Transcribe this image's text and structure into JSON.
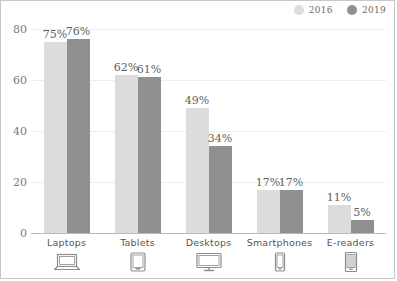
{
  "chart_data": {
    "type": "bar",
    "title": "",
    "subtitle": "",
    "xlabel": "",
    "ylabel": "",
    "ylim": [
      0,
      80
    ],
    "yticks": [
      "0",
      "20",
      "40",
      "60",
      "80"
    ],
    "ytick_values": [
      0,
      20,
      40,
      60,
      80
    ],
    "grid": true,
    "legend_position": "top-right",
    "categories": [
      "Laptops",
      "Tablets",
      "Desktops",
      "Smartphones",
      "E-readers"
    ],
    "category_icons": [
      "laptop-icon",
      "tablet-icon",
      "desktop-monitor-icon",
      "smartphone-icon",
      "e-reader-icon"
    ],
    "series": [
      {
        "name": "2016",
        "color": "#dcdcdc",
        "values": [
          75,
          62,
          49,
          17,
          11
        ],
        "labels": [
          "75%",
          "62%",
          "49%",
          "17%",
          "11%"
        ]
      },
      {
        "name": "2019",
        "color": "#909090",
        "values": [
          76,
          61,
          34,
          17,
          5
        ],
        "labels": [
          "76%",
          "61%",
          "34%",
          "17%",
          "5%"
        ]
      }
    ]
  },
  "legend": {
    "items": [
      {
        "label": "2016",
        "color": "#dcdcdc",
        "marker": "circle-marker-2016"
      },
      {
        "label": "2019",
        "color": "#909090",
        "marker": "circle-marker-2019"
      }
    ]
  },
  "colors": {
    "series_2016": "#dcdcdc",
    "series_2019": "#909090",
    "gridline": "#ededed",
    "axis": "#b9b9b9",
    "tick_text": "#7a7a7a",
    "label_text": "#5f5f5f",
    "category_text": "#555555",
    "border": "#c8c8c8",
    "background": "#ffffff"
  }
}
